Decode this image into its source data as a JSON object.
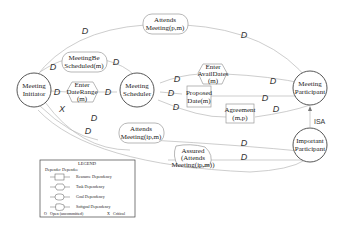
{
  "actors": [
    {
      "id": "initiator",
      "lines": [
        "Meeting",
        "Initiator"
      ]
    },
    {
      "id": "scheduler",
      "lines": [
        "Meeting",
        "Scheduler"
      ]
    },
    {
      "id": "participant",
      "lines": [
        "Meeting",
        "Participant"
      ]
    },
    {
      "id": "important",
      "lines": [
        "Important",
        "Participant"
      ]
    }
  ],
  "dependums": {
    "attends_top": {
      "type": "goal",
      "lines": [
        "Attends",
        "Meeting(p,m)"
      ]
    },
    "be_scheduled": {
      "type": "goal",
      "lines": [
        "MeetingBe",
        "Scheduled(m)"
      ]
    },
    "enter_date_range": {
      "type": "task",
      "lines": [
        "Enter",
        "DateRange",
        "(m)"
      ]
    },
    "enter_avail_dates": {
      "type": "task",
      "lines": [
        "Enter",
        "AvailDates",
        "(m)"
      ]
    },
    "proposed_date": {
      "type": "resource",
      "lines": [
        "Proposed",
        "Date(m)"
      ]
    },
    "agreement": {
      "type": "resource",
      "lines": [
        "Agreement",
        "(m,p)"
      ]
    },
    "attends_ip": {
      "type": "goal",
      "lines": [
        "Attends",
        "Meeting(ip,m)"
      ]
    },
    "assured": {
      "type": "softgoal",
      "lines": [
        "Assured",
        "(Attends",
        "Meeting(ip,m))"
      ]
    }
  },
  "marks": {
    "d": "D",
    "x": "X",
    "isa": "ISA"
  },
  "legend": {
    "title": "LEGEND",
    "depender": "Depender",
    "dependee": "Dependee",
    "items": [
      "Resource Dependency",
      "Task Dependency",
      "Goal Dependency",
      "Softgoal Dependency"
    ],
    "open": "Open (uncommitted)",
    "critical": "Critical",
    "open_mark": "O",
    "critical_mark": "X"
  }
}
